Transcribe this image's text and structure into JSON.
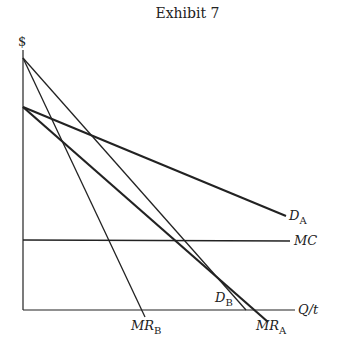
{
  "title": "Exhibit 7",
  "axes": {
    "y_label": "$",
    "x_label": "Q/t"
  },
  "curves": {
    "DA": {
      "main": "D",
      "sub": "A"
    },
    "DB": {
      "main": "D",
      "sub": "B"
    },
    "MRA": {
      "main": "MR",
      "sub": "A"
    },
    "MRB": {
      "main": "MR",
      "sub": "B"
    },
    "MC": {
      "main": "MC"
    }
  }
}
